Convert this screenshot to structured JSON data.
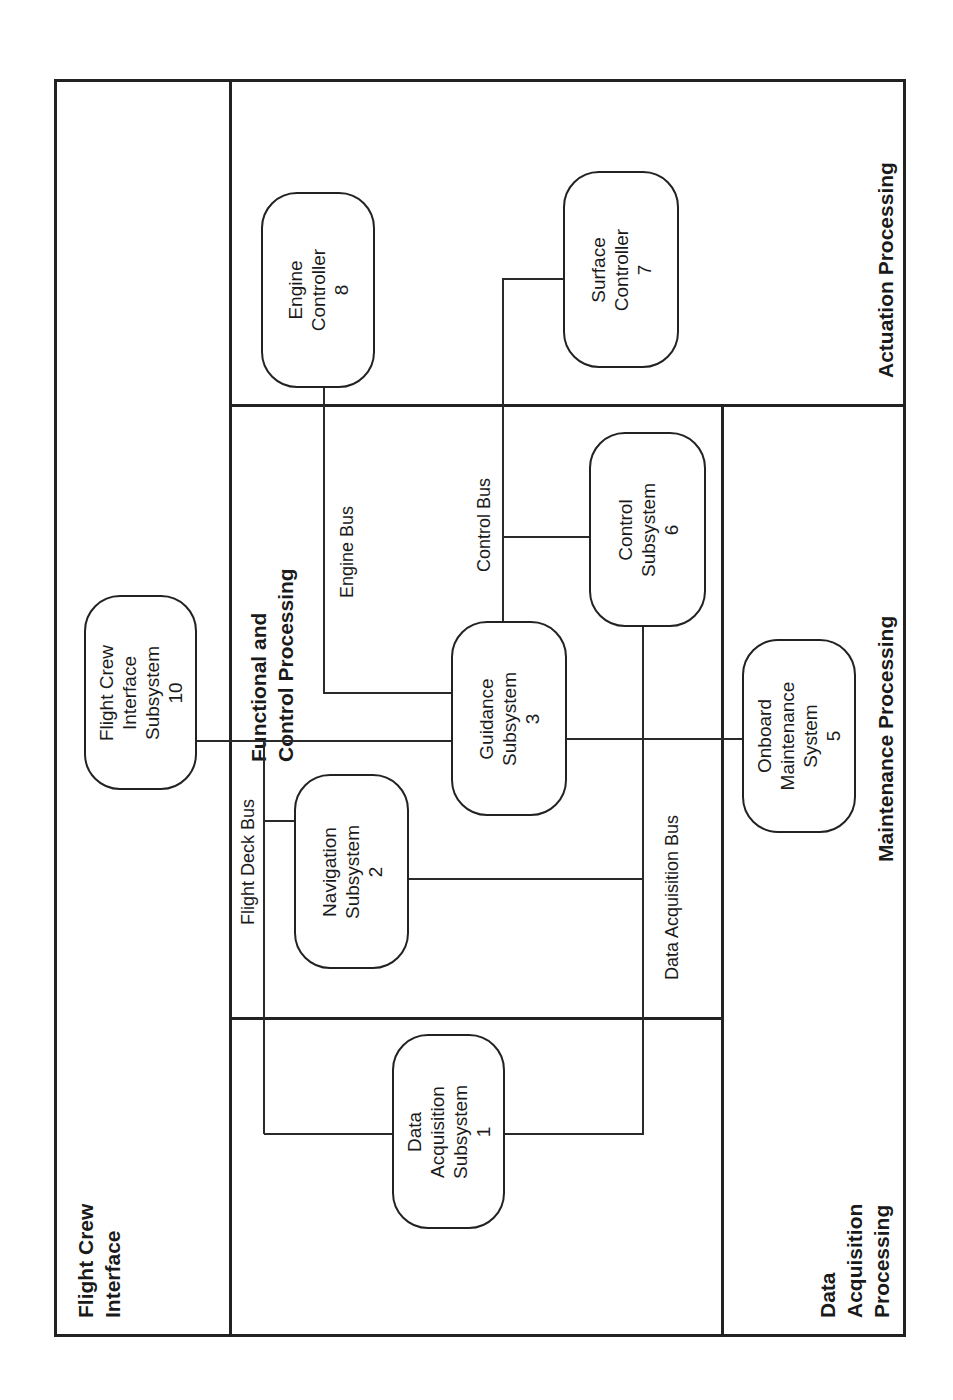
{
  "diagram": {
    "orientation": "rotated-90-ccw",
    "regions": {
      "flight_crew_interface": {
        "line1": "Flight Crew",
        "line2": "Interface"
      },
      "functional_control": {
        "line1": "Functional and",
        "line2": "Control Processing"
      },
      "actuation": {
        "label": "Actuation Processing"
      },
      "maintenance": {
        "label": "Maintenance Processing"
      },
      "data_acquisition": {
        "line1": "Data",
        "line2": "Acquisition",
        "line3": "Processing"
      }
    },
    "buses": {
      "flight_deck": "Flight Deck Bus",
      "engine": "Engine Bus",
      "control": "Control Bus",
      "data_acquisition": "Data Acquisition Bus"
    },
    "nodes": {
      "n1": {
        "l1": "Data",
        "l2": "Acquisition",
        "l3": "Subsystem",
        "num": "1"
      },
      "n2": {
        "l1": "Navigation",
        "l2": "Subsystem",
        "num": "2"
      },
      "n3": {
        "l1": "Guidance",
        "l2": "Subsystem",
        "num": "3"
      },
      "n5": {
        "l1": "Onboard",
        "l2": "Maintenance",
        "l3": "System",
        "num": "5"
      },
      "n6": {
        "l1": "Control",
        "l2": "Subsystem",
        "num": "6"
      },
      "n7": {
        "l1": "Surface",
        "l2": "Controller",
        "num": "7"
      },
      "n8": {
        "l1": "Engine",
        "l2": "Controller",
        "num": "8"
      },
      "n10": {
        "l1": "Flight Crew",
        "l2": "Interface",
        "l3": "Subsystem",
        "num": "10"
      }
    },
    "colors": {
      "line": "#222222",
      "background": "#ffffff"
    }
  }
}
